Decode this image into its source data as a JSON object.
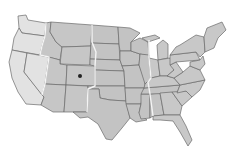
{
  "map": {
    "subject": "Contiguous United States with time zones",
    "colors": {
      "background": "#ffffff",
      "pacific": "#e2e2e2",
      "mountain": "#c6c6c6",
      "central": "#c3c3c3",
      "eastern": "#c8c8c8",
      "state_border": "#6a6a6a",
      "timezone_border": "#f4f4f4",
      "marker": "#222222"
    },
    "time_zones": [
      "Pacific",
      "Mountain",
      "Central",
      "Eastern"
    ],
    "markers": [
      {
        "name": "location-marker",
        "state": "Colorado",
        "x": 80,
        "y": 76
      }
    ]
  }
}
